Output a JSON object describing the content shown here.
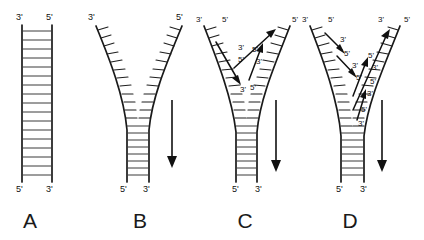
{
  "figure": {
    "background_color": "#ffffff",
    "line_color": "#1a1a1a",
    "rung_color": "#3a3a3a",
    "width": 424,
    "height": 240
  },
  "panels": [
    {
      "id": "A",
      "label": "A",
      "label_x": 30,
      "label_y": 228,
      "description": "Intact parental DNA double helix drawn as a ladder",
      "top_labels": [
        {
          "text": "3'",
          "x": 16,
          "y": 20
        },
        {
          "text": "5'",
          "x": 46,
          "y": 20
        }
      ],
      "bottom_labels": [
        {
          "text": "5'",
          "x": 16,
          "y": 192
        },
        {
          "text": "3'",
          "x": 46,
          "y": 192
        }
      ],
      "left_backbone": "M 22 25 L 22 182",
      "right_backbone": "M 52 25 L 52 182",
      "rung_count": 17,
      "rung_top": 30,
      "rung_bottom": 178,
      "rung_x1": 22,
      "rung_x2": 52,
      "arrow": null,
      "new_strands": []
    },
    {
      "id": "B",
      "label": "B",
      "label_x": 140,
      "label_y": 228,
      "description": "Parental strands unwinding to form a replication fork; arrow shows fork movement direction",
      "top_labels": [
        {
          "text": "3'",
          "x": 88,
          "y": 20
        },
        {
          "text": "5'",
          "x": 176,
          "y": 20
        }
      ],
      "bottom_labels": [
        {
          "text": "5'",
          "x": 120,
          "y": 192
        },
        {
          "text": "3'",
          "x": 143,
          "y": 192
        }
      ],
      "left_backbone": "M 96 26 C 110 60 124 96 127 130 L 127 182",
      "right_backbone": "M 182 26 C 168 60 152 96 149 130 L 149 182",
      "arrow": {
        "x": 172,
        "y_top": 100,
        "y_bottom": 166
      },
      "new_strands": []
    },
    {
      "id": "C",
      "label": "C",
      "label_x": 245,
      "label_y": 228,
      "description": "New daughter strands begin synthesis at the fork; arrowheads mark 3' growing ends",
      "top_labels": [
        {
          "text": "3'",
          "x": 196,
          "y": 22
        },
        {
          "text": "5'",
          "x": 222,
          "y": 22
        },
        {
          "text": "5'",
          "x": 292,
          "y": 22
        }
      ],
      "inner_labels": [
        {
          "text": "3'",
          "x": 238,
          "y": 50
        },
        {
          "text": "5'",
          "x": 238,
          "y": 62
        },
        {
          "text": "3'",
          "x": 240,
          "y": 88
        },
        {
          "text": "5'",
          "x": 252,
          "y": 52
        },
        {
          "text": "3'",
          "x": 256,
          "y": 64
        },
        {
          "text": "5'",
          "x": 248,
          "y": 86
        }
      ],
      "bottom_labels": [
        {
          "text": "5'",
          "x": 232,
          "y": 192
        },
        {
          "text": "3'",
          "x": 255,
          "y": 192
        }
      ],
      "left_backbone": "M 204 26 C 218 62 232 98 236 132 L 236 182",
      "right_backbone": "M 290 26 C 276 62 260 98 257 132 L 257 182",
      "arrow": {
        "x": 276,
        "y_top": 100,
        "y_bottom": 170
      },
      "new_strands": [
        {
          "from": "leading",
          "path": "M 232 66 L 276 30"
        },
        {
          "from": "lagging-1",
          "path": "M 218 44 L 241 83"
        },
        {
          "from": "lagging-2",
          "path": "M 250 78 L 262 46"
        }
      ]
    },
    {
      "id": "D",
      "label": "D",
      "label_x": 350,
      "label_y": 228,
      "description": "Fork has advanced further; leading strand extended and several Okazaki fragments present on the lagging strand",
      "top_labels": [
        {
          "text": "3'",
          "x": 302,
          "y": 22
        },
        {
          "text": "5'",
          "x": 328,
          "y": 22
        },
        {
          "text": "3'",
          "x": 378,
          "y": 22
        },
        {
          "text": "5'",
          "x": 404,
          "y": 22
        }
      ],
      "inner_labels": [
        {
          "text": "3'",
          "x": 340,
          "y": 42
        },
        {
          "text": "5'",
          "x": 344,
          "y": 54
        },
        {
          "text": "3'",
          "x": 352,
          "y": 66
        },
        {
          "text": "5'",
          "x": 356,
          "y": 78
        },
        {
          "text": "5'",
          "x": 362,
          "y": 110
        },
        {
          "text": "3'",
          "x": 360,
          "y": 122
        },
        {
          "text": "5'",
          "x": 368,
          "y": 58
        },
        {
          "text": "3'",
          "x": 372,
          "y": 70
        },
        {
          "text": "5'",
          "x": 370,
          "y": 82
        },
        {
          "text": "3'",
          "x": 368,
          "y": 94
        }
      ],
      "bottom_labels": [
        {
          "text": "5'",
          "x": 336,
          "y": 192
        },
        {
          "text": "3'",
          "x": 360,
          "y": 192
        }
      ],
      "left_backbone": "M 310 26 C 324 62 338 100 341 136 L 341 182",
      "right_backbone": "M 400 26 C 386 62 368 100 364 136 L 364 182",
      "arrow": {
        "x": 382,
        "y_top": 100,
        "y_bottom": 170
      },
      "new_strands": [
        {
          "from": "leading",
          "path": "M 352 108 L 390 30"
        },
        {
          "from": "lagging-1",
          "path": "M 326 34 L 344 52"
        },
        {
          "from": "lagging-2",
          "path": "M 338 56 L 356 76"
        },
        {
          "from": "lagging-3",
          "path": "M 352 96 L 366 60"
        },
        {
          "from": "lagging-4",
          "path": "M 356 118 L 364 92"
        }
      ]
    }
  ],
  "legend": {
    "arrow_meaning": "direction of replication fork movement"
  }
}
